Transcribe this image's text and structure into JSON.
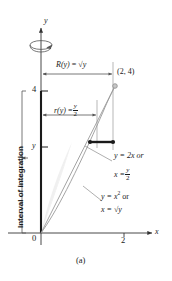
{
  "figure": {
    "caption": "(a)",
    "axes": {
      "y_axis_label": "y",
      "x_axis_label": "x",
      "origin_label": "0",
      "y_ticks": [
        {
          "value": 4,
          "label": "4"
        },
        {
          "value": 2.1,
          "label": "y"
        }
      ],
      "x_ticks": [
        {
          "value": 2,
          "label": "2"
        }
      ]
    },
    "point_label": "(2, 4)",
    "outer_radius": {
      "name": "R(y)",
      "equals": "=",
      "expression": "√y",
      "full": "R(y) = √y"
    },
    "inner_radius": {
      "name": "r(y)",
      "equals": "=",
      "numerator": "y",
      "denominator": "2",
      "full": "r(y) = y/2"
    },
    "interval_label": "Interval of integration",
    "curve_line": {
      "line1": "y = 2x or",
      "line2_lhs": "x =",
      "numerator": "y",
      "denominator": "2"
    },
    "curve_parabola": {
      "line1_lhs": "y = x",
      "line1_exp": "2",
      "line1_or": "or",
      "line2": "x = √y"
    },
    "icons": {
      "revolution": "revolution-arrow-icon",
      "y_axis_arrow": "arrow-up-icon",
      "x_axis_arrow": "arrow-right-icon"
    },
    "colors": {
      "ink": "#1a1a1a",
      "curve": "#9a9a9a",
      "fill": "#efefef",
      "axis": "#555555",
      "thin": "#8d8d8d"
    }
  }
}
